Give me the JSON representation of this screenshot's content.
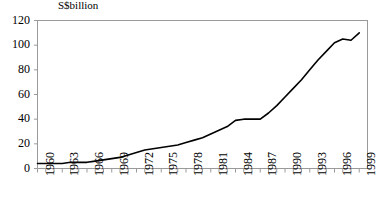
{
  "chart_data": {
    "type": "line",
    "title": "",
    "subtitle": "",
    "unit_label": "S$billion",
    "xlabel": "",
    "ylabel": "S$billion",
    "ylim": [
      0,
      120
    ],
    "xlim": [
      1960,
      2000
    ],
    "y_ticks": [
      0,
      20,
      40,
      60,
      80,
      100,
      120
    ],
    "x_tick_labels": [
      "1960",
      "1963",
      "1966",
      "1969",
      "1972",
      "1975",
      "1978",
      "1981",
      "1984",
      "1987",
      "1990",
      "1993",
      "1996",
      "1999"
    ],
    "x_tick_label_years": [
      1960,
      1963,
      1966,
      1969,
      1972,
      1975,
      1978,
      1981,
      1984,
      1987,
      1990,
      1993,
      1996,
      1999
    ],
    "x_minor_tick_years": [
      1960,
      1961,
      1962,
      1963,
      1964,
      1965,
      1966,
      1967,
      1968,
      1969,
      1970,
      1971,
      1972,
      1973,
      1974,
      1975,
      1976,
      1977,
      1978,
      1979,
      1980,
      1981,
      1982,
      1983,
      1984,
      1985,
      1986,
      1987,
      1988,
      1989,
      1990,
      1991,
      1992,
      1993,
      1994,
      1995,
      1996,
      1997,
      1998,
      1999
    ],
    "grid": false,
    "legend": false,
    "legend_position": "none",
    "line_color": "#000000",
    "axis_color": "#808080",
    "x": [
      1960,
      1961,
      1962,
      1963,
      1964,
      1965,
      1966,
      1967,
      1968,
      1969,
      1970,
      1971,
      1972,
      1973,
      1974,
      1975,
      1976,
      1977,
      1978,
      1979,
      1980,
      1981,
      1982,
      1983,
      1984,
      1985,
      1986,
      1987,
      1988,
      1989,
      1990,
      1991,
      1992,
      1993,
      1994,
      1995,
      1996,
      1997,
      1998,
      1999
    ],
    "values": [
      4,
      4,
      4,
      4,
      5,
      5,
      5,
      6,
      7,
      8,
      9,
      11,
      13,
      15,
      16,
      17,
      18,
      19,
      21,
      23,
      25,
      28,
      31,
      34,
      39,
      40,
      40,
      40,
      45,
      51,
      58,
      65,
      72,
      80,
      88,
      95,
      102,
      105,
      104,
      110
    ]
  }
}
